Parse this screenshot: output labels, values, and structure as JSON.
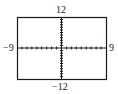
{
  "chart_data": {
    "type": "line",
    "title": "",
    "xlabel": "",
    "ylabel": "",
    "xlim": [
      -9,
      9
    ],
    "ylim": [
      -12,
      12
    ],
    "x_ticks_step": 1,
    "y_ticks_step": 1,
    "grid": false,
    "series": [],
    "labels": {
      "ymax": "12",
      "ymin": "−12",
      "xmin": "−9",
      "xmax": "9"
    }
  },
  "colors": {
    "frame": "#1a1a1a",
    "axis": "#1a1a1a",
    "background": "#ffffff"
  }
}
